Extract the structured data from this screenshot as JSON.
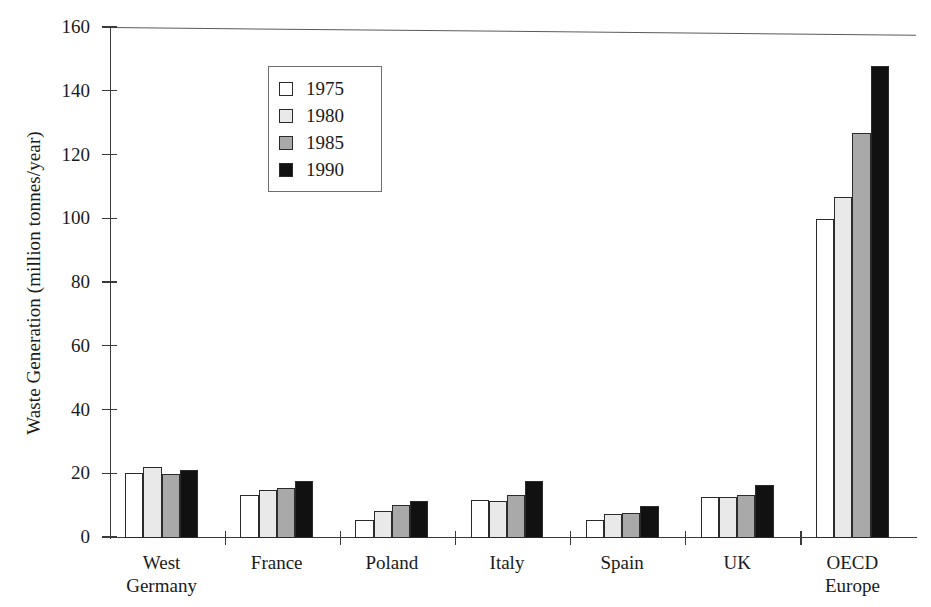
{
  "chart_data": {
    "type": "bar",
    "title": "",
    "xlabel": "",
    "ylabel": "Waste Generation (million tonnes/year)",
    "categories": [
      "West Germany",
      "France",
      "Poland",
      "Italy",
      "Spain",
      "UK",
      "OECD Europe"
    ],
    "category_lines": [
      [
        "West",
        "Germany"
      ],
      [
        "France"
      ],
      [
        "Poland"
      ],
      [
        "Italy"
      ],
      [
        "Spain"
      ],
      [
        "UK"
      ],
      [
        "OECD",
        "Europe"
      ]
    ],
    "ylim": [
      0,
      160
    ],
    "yticks": [
      0,
      20,
      40,
      60,
      80,
      100,
      120,
      140,
      160
    ],
    "ytick_labels": [
      "0",
      "20",
      "40",
      "60",
      "80",
      "100",
      "120",
      "140",
      "160"
    ],
    "grid": false,
    "legend_position": "upper-left-inside",
    "series": [
      {
        "name": "1975",
        "color": "#ffffff",
        "values": [
          20.5,
          13.5,
          5.5,
          12.0,
          5.5,
          13.0,
          100.0
        ]
      },
      {
        "name": "1980",
        "color": "#e9e9e9",
        "values": [
          22.3,
          15.0,
          8.5,
          11.7,
          7.5,
          12.8,
          107.0
        ]
      },
      {
        "name": "1985",
        "color": "#a9a9a9",
        "values": [
          20.2,
          15.8,
          10.3,
          13.4,
          7.8,
          13.5,
          127.0
        ]
      },
      {
        "name": "1990",
        "color": "#111111",
        "values": [
          21.2,
          18.0,
          11.5,
          18.0,
          10.0,
          16.5,
          148.0
        ]
      }
    ]
  },
  "legend": {
    "items": [
      {
        "label": "1975",
        "color": "#ffffff"
      },
      {
        "label": "1980",
        "color": "#e9e9e9"
      },
      {
        "label": "1985",
        "color": "#a9a9a9"
      },
      {
        "label": "1990",
        "color": "#111111"
      }
    ]
  },
  "axis": {
    "y_title": "Waste Generation (million tonnes/year)"
  }
}
